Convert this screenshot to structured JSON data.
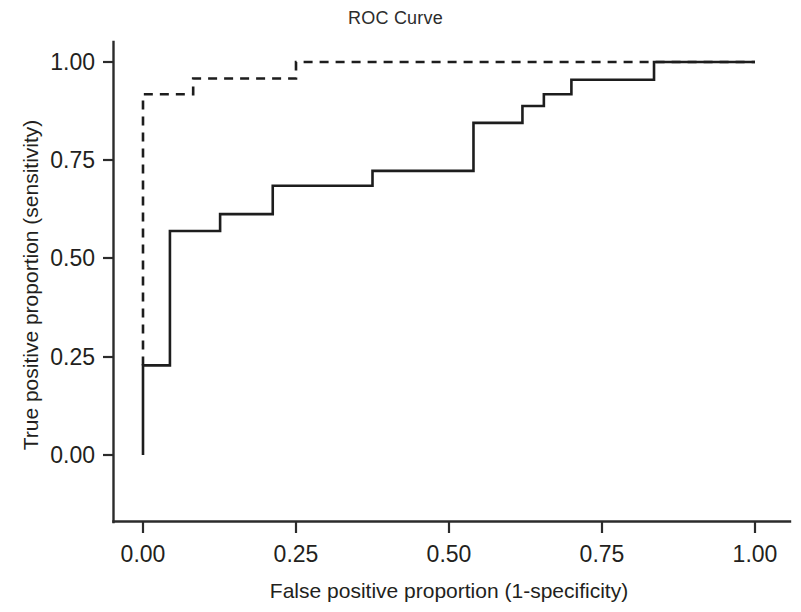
{
  "figure": {
    "width": 801,
    "height": 612,
    "background": "#ffffff",
    "ink_color": "#1d1d1d"
  },
  "chart_data": {
    "type": "line",
    "title": "ROC Curve",
    "xlabel": "False positive proportion (1-specificity)",
    "ylabel": "True positive proportion (sensitivity)",
    "xlim": [
      0.0,
      1.0
    ],
    "ylim": [
      0.0,
      1.0
    ],
    "xticks": [
      0.0,
      0.25,
      0.5,
      0.75,
      1.0
    ],
    "yticks": [
      0.0,
      0.25,
      0.5,
      0.75,
      1.0
    ],
    "xticklabels": [
      "0.00",
      "0.25",
      "0.50",
      "0.75",
      "1.00"
    ],
    "yticklabels": [
      "0.00",
      "0.25",
      "0.50",
      "0.75",
      "1.00"
    ],
    "grid": false,
    "legend": "none",
    "series": [
      {
        "name": "roc-solid",
        "style": "solid",
        "color": "#1d1d1d",
        "drawstyle": "steps-post",
        "points": [
          [
            0.0,
            0.0
          ],
          [
            0.0,
            0.228
          ],
          [
            0.044,
            0.228
          ],
          [
            0.044,
            0.57
          ],
          [
            0.126,
            0.57
          ],
          [
            0.126,
            0.613
          ],
          [
            0.212,
            0.613
          ],
          [
            0.212,
            0.685
          ],
          [
            0.375,
            0.685
          ],
          [
            0.375,
            0.723
          ],
          [
            0.54,
            0.723
          ],
          [
            0.54,
            0.845
          ],
          [
            0.62,
            0.845
          ],
          [
            0.62,
            0.888
          ],
          [
            0.655,
            0.888
          ],
          [
            0.655,
            0.918
          ],
          [
            0.7,
            0.918
          ],
          [
            0.7,
            0.955
          ],
          [
            0.835,
            0.955
          ],
          [
            0.835,
            1.0
          ],
          [
            1.0,
            1.0
          ]
        ]
      },
      {
        "name": "roc-dashed",
        "style": "dashed",
        "color": "#1d1d1d",
        "drawstyle": "steps-post",
        "points": [
          [
            0.0,
            0.228
          ],
          [
            0.0,
            0.918
          ],
          [
            0.082,
            0.918
          ],
          [
            0.082,
            0.958
          ],
          [
            0.25,
            0.958
          ],
          [
            0.25,
            1.0
          ],
          [
            1.0,
            1.0
          ]
        ]
      }
    ]
  }
}
